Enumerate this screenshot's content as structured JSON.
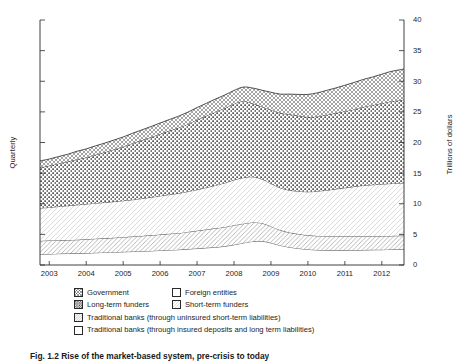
{
  "figure": {
    "caption": "Fig. 1.2   Rise of the market-based system, pre-crisis to today"
  },
  "axes": {
    "left_title": "Quarterly",
    "right_title": "Trillions of dollars",
    "x_ticks": [
      "2003",
      "2004",
      "2005",
      "2006",
      "2007",
      "2008",
      "2009",
      "2010",
      "2011",
      "2012"
    ],
    "y_ticks": [
      "0",
      "5",
      "10",
      "15",
      "20",
      "25",
      "30",
      "35",
      "40"
    ]
  },
  "legend": {
    "rows": [
      [
        {
          "label": "Government",
          "pattern": "crosshatch"
        },
        {
          "label": "Foreign entities",
          "pattern": "blank"
        }
      ],
      [
        {
          "label": "Long-term funders",
          "pattern": "dots"
        },
        {
          "label": "Short-term funders",
          "pattern": "lighthatch"
        }
      ],
      [
        {
          "label": "Traditional banks (through uninsured short-term liabilities)",
          "pattern": "diaghatch"
        }
      ],
      [
        {
          "label": "Traditional banks (through insured deposits and long term liabilities)",
          "pattern": "blank"
        }
      ]
    ]
  },
  "chart_data": {
    "type": "area",
    "title": "",
    "xlabel": "",
    "ylabel": "Trillions of dollars",
    "ylabel_secondary": "Quarterly",
    "xlim": [
      2002.5,
      2012.35
    ],
    "ylim": [
      0,
      40
    ],
    "grid": false,
    "legend_position": "below",
    "stacked": true,
    "x": [
      2002.5,
      2002.75,
      2003.0,
      2003.25,
      2003.5,
      2003.75,
      2004.0,
      2004.25,
      2004.5,
      2004.75,
      2005.0,
      2005.25,
      2005.5,
      2005.75,
      2006.0,
      2006.25,
      2006.5,
      2006.75,
      2007.0,
      2007.25,
      2007.5,
      2007.75,
      2008.0,
      2008.25,
      2008.5,
      2008.75,
      2009.0,
      2009.25,
      2009.5,
      2009.75,
      2010.0,
      2010.25,
      2010.5,
      2010.75,
      2011.0,
      2011.25,
      2011.5,
      2011.75,
      2012.0,
      2012.35
    ],
    "series": [
      {
        "name": "Traditional banks (through insured deposits and long term liabilities)",
        "pattern": "blank",
        "values": [
          1.75,
          1.8,
          1.85,
          1.88,
          1.92,
          1.95,
          2.0,
          2.05,
          2.1,
          2.15,
          2.2,
          2.25,
          2.3,
          2.38,
          2.45,
          2.5,
          2.6,
          2.7,
          2.8,
          2.9,
          3.05,
          3.3,
          3.6,
          3.85,
          3.9,
          3.6,
          3.2,
          2.9,
          2.7,
          2.55,
          2.45,
          2.4,
          2.4,
          2.4,
          2.42,
          2.45,
          2.48,
          2.5,
          2.55,
          2.6
        ]
      },
      {
        "name": "Traditional banks (through uninsured short-term liabilities)",
        "pattern": "diaghatch",
        "values": [
          2.2,
          2.2,
          2.2,
          2.2,
          2.2,
          2.25,
          2.3,
          2.3,
          2.35,
          2.4,
          2.45,
          2.5,
          2.55,
          2.6,
          2.65,
          2.7,
          2.8,
          2.9,
          3.0,
          3.1,
          3.15,
          3.2,
          3.15,
          3.1,
          2.95,
          2.7,
          2.5,
          2.4,
          2.35,
          2.3,
          2.3,
          2.3,
          2.3,
          2.3,
          2.28,
          2.25,
          2.22,
          2.2,
          2.2,
          2.2
        ]
      },
      {
        "name": "Short-term funders",
        "pattern": "lighthatch",
        "values": [
          5.35,
          5.4,
          5.5,
          5.6,
          5.7,
          5.75,
          5.8,
          5.85,
          5.9,
          5.95,
          6.0,
          6.1,
          6.2,
          6.3,
          6.4,
          6.5,
          6.6,
          6.7,
          6.85,
          7.0,
          7.2,
          7.4,
          7.5,
          7.45,
          7.2,
          7.0,
          6.9,
          6.9,
          7.0,
          7.1,
          7.3,
          7.5,
          7.7,
          7.9,
          8.1,
          8.3,
          8.4,
          8.5,
          8.55,
          8.6
        ]
      },
      {
        "name": "Long-term funders",
        "pattern": "dots",
        "values": [
          6.6,
          6.8,
          7.0,
          7.2,
          7.4,
          7.6,
          7.9,
          8.2,
          8.5,
          8.8,
          9.2,
          9.5,
          9.8,
          10.1,
          10.4,
          10.7,
          11.0,
          11.4,
          11.7,
          12.0,
          12.2,
          12.4,
          12.5,
          12.0,
          11.8,
          12.0,
          12.2,
          12.4,
          12.3,
          12.2,
          12.2,
          12.3,
          12.4,
          12.5,
          12.6,
          12.8,
          13.0,
          13.2,
          13.4,
          13.6
        ]
      },
      {
        "name": "Government",
        "pattern": "crosshatch",
        "values": [
          1.1,
          1.1,
          1.15,
          1.2,
          1.35,
          1.4,
          1.45,
          1.5,
          1.55,
          1.6,
          1.65,
          1.7,
          1.75,
          1.8,
          1.85,
          1.9,
          1.95,
          2.0,
          2.05,
          2.1,
          2.15,
          2.2,
          2.3,
          2.5,
          2.7,
          2.9,
          3.1,
          3.3,
          3.5,
          3.7,
          3.85,
          4.0,
          4.1,
          4.25,
          4.4,
          4.5,
          4.6,
          4.75,
          4.9,
          5.0
        ]
      }
    ],
    "cumulative_top_total": [
      17.0,
      17.3,
      17.7,
      18.08,
      18.57,
      18.95,
      19.45,
      19.9,
      20.4,
      20.9,
      21.5,
      22.05,
      22.6,
      23.18,
      23.75,
      24.3,
      24.95,
      25.7,
      26.4,
      27.1,
      27.75,
      28.5,
      29.05,
      28.9,
      28.55,
      28.2,
      27.9,
      27.9,
      27.85,
      27.85,
      28.1,
      28.5,
      28.9,
      29.35,
      29.8,
      30.3,
      30.7,
      31.15,
      31.6,
      32.0
    ]
  }
}
